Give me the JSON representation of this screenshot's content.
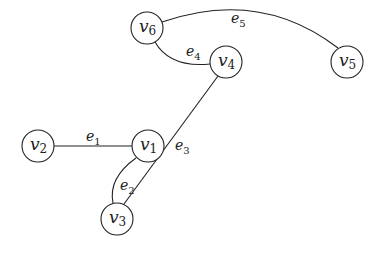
{
  "diagram": {
    "type": "graph",
    "nodes": [
      {
        "id": "v1",
        "base": "v",
        "sub": "1",
        "x": 148,
        "y": 146
      },
      {
        "id": "v2",
        "base": "v",
        "sub": "2",
        "x": 38,
        "y": 146
      },
      {
        "id": "v3",
        "base": "v",
        "sub": "3",
        "x": 117,
        "y": 219
      },
      {
        "id": "v4",
        "base": "v",
        "sub": "4",
        "x": 226,
        "y": 62
      },
      {
        "id": "v5",
        "base": "v",
        "sub": "5",
        "x": 347,
        "y": 62
      },
      {
        "id": "v6",
        "base": "v",
        "sub": "6",
        "x": 147,
        "y": 28
      }
    ],
    "edges": [
      {
        "id": "e1",
        "base": "e",
        "sub": "1",
        "from": "v2",
        "to": "v1"
      },
      {
        "id": "e2",
        "base": "e",
        "sub": "2",
        "from": "v1",
        "to": "v3"
      },
      {
        "id": "e3",
        "base": "e",
        "sub": "3",
        "from": "v4",
        "to": "v3"
      },
      {
        "id": "e4",
        "base": "e",
        "sub": "4",
        "from": "v6",
        "to": "v4"
      },
      {
        "id": "e5",
        "base": "e",
        "sub": "5",
        "from": "v6",
        "to": "v5"
      }
    ]
  }
}
